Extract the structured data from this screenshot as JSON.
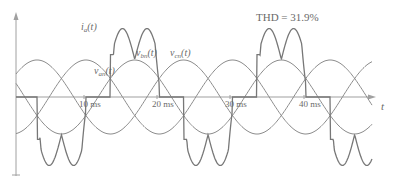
{
  "chart_data": {
    "type": "line",
    "title": "",
    "annotation": "THD = 31.9%",
    "xlabel": "t",
    "ylabel": "",
    "x_unit": "ms",
    "xlim": [
      0,
      50
    ],
    "x_ticks": [
      {
        "value": 10,
        "label": "10 ms"
      },
      {
        "value": 20,
        "label": "20 ms"
      },
      {
        "value": 30,
        "label": "30 ms"
      },
      {
        "value": 40,
        "label": "40 ms"
      }
    ],
    "grid": false,
    "legend": "inline labels",
    "fundamental_frequency_hz": 50,
    "series": [
      {
        "name": "v_an(t)",
        "label_main": "v",
        "label_sub": "an",
        "kind": "sinusoid",
        "phase_deg": 0,
        "relative_amplitude": 1.0
      },
      {
        "name": "v_bn(t)",
        "label_main": "v",
        "label_sub": "bn",
        "kind": "sinusoid",
        "phase_deg": -120,
        "relative_amplitude": 1.0
      },
      {
        "name": "v_cn(t)",
        "label_main": "v",
        "label_sub": "cn",
        "kind": "sinusoid",
        "phase_deg": 120,
        "relative_amplitude": 1.0
      },
      {
        "name": "i_a(t)",
        "label_main": "i",
        "label_sub": "a",
        "kind": "rectifier line current (double-hump pulses, 120° conduction)",
        "relative_amplitude": 1.85
      }
    ]
  },
  "labels": {
    "thd": "THD = 31.9%",
    "t_axis": "t",
    "ia_main": "i",
    "ia_sub": "a",
    "ia_tail": "(t)",
    "van_main": "v",
    "van_sub": "an",
    "van_tail": "(t)",
    "vbn_main": "v",
    "vbn_sub": "bn",
    "vbn_tail": "(t)",
    "vcn_main": "v",
    "vcn_sub": "cn",
    "vcn_tail": "(t)",
    "tick_10": "10 ms",
    "tick_20": "20 ms",
    "tick_30": "30 ms",
    "tick_40": "40 ms"
  },
  "colors": {
    "curve": "#8a8a8a",
    "current": "#7a7a7a",
    "axis": "#9a9a9a",
    "text": "#6a6a6a"
  }
}
